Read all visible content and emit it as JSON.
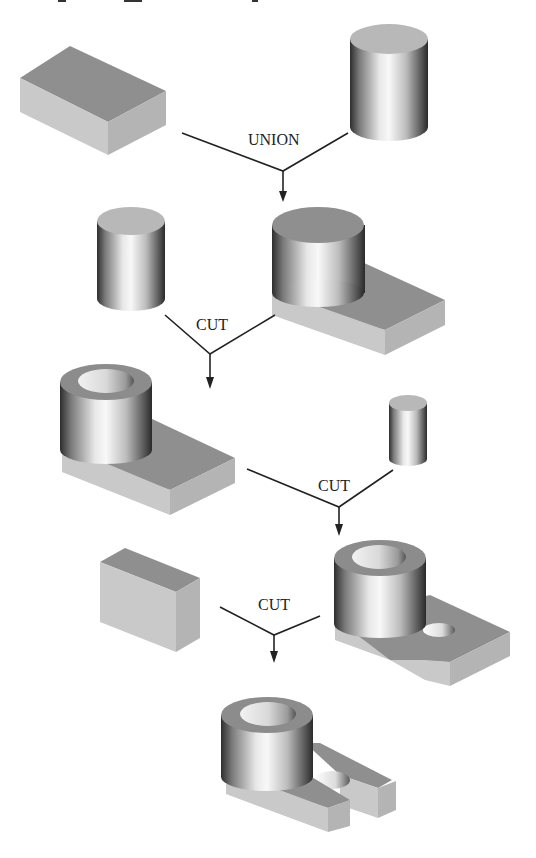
{
  "header_caption_cropped": "",
  "colors": {
    "background": "#ffffff",
    "line": "#222222",
    "top_face": "#8f8f8f",
    "front_face": "#c9c9c9",
    "side_face": "#b4b4b4",
    "cylinder_dark": "#3a3a3a",
    "cylinder_light": "#f4f4f4"
  },
  "operations": [
    {
      "id": "op1",
      "label": "UNION",
      "inputs": [
        "block",
        "cylinder-large"
      ],
      "output": "block-with-boss"
    },
    {
      "id": "op2",
      "label": "CUT",
      "inputs": [
        "cylinder-medium",
        "block-with-boss"
      ],
      "output": "boss-with-bore"
    },
    {
      "id": "op3",
      "label": "CUT",
      "inputs": [
        "boss-with-bore",
        "cylinder-small"
      ],
      "output": "part-with-hole"
    },
    {
      "id": "op4",
      "label": "CUT",
      "inputs": [
        "block-small",
        "part-with-hole"
      ],
      "output": "final-slotted-part"
    }
  ],
  "shapes": [
    {
      "id": "block",
      "kind": "box"
    },
    {
      "id": "cylinder-large",
      "kind": "cylinder"
    },
    {
      "id": "cylinder-medium",
      "kind": "cylinder"
    },
    {
      "id": "block-with-boss",
      "kind": "solid"
    },
    {
      "id": "boss-with-bore",
      "kind": "solid"
    },
    {
      "id": "cylinder-small",
      "kind": "cylinder"
    },
    {
      "id": "block-small",
      "kind": "box"
    },
    {
      "id": "part-with-hole",
      "kind": "solid"
    },
    {
      "id": "final-slotted-part",
      "kind": "solid"
    }
  ]
}
